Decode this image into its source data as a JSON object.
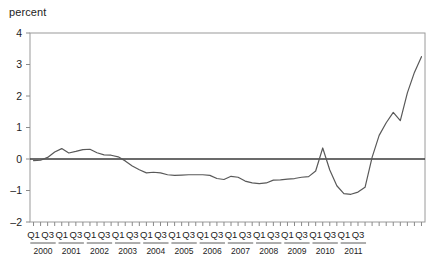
{
  "chart_data": {
    "type": "line",
    "title": "",
    "subtitle": "",
    "xlabel": "",
    "ylabel": "percent",
    "ylim": [
      -2,
      4
    ],
    "yticks": [
      4,
      3,
      2,
      1,
      0,
      -1,
      -2
    ],
    "ytick_labels": [
      "4",
      "3",
      "2",
      "1",
      "0",
      "-1",
      "-2"
    ],
    "grid": false,
    "legend": "none",
    "zero_line": true,
    "x_quarter_labels": [
      "Q1",
      "Q3"
    ],
    "years": [
      "2000",
      "2001",
      "2002",
      "2003",
      "2004",
      "2005",
      "2006",
      "2007",
      "2008",
      "2009",
      "2010",
      "2011"
    ],
    "x": [
      "2000Q1",
      "2000Q2",
      "2000Q3",
      "2000Q4",
      "2001Q1",
      "2001Q2",
      "2001Q3",
      "2001Q4",
      "2002Q1",
      "2002Q2",
      "2002Q3",
      "2002Q4",
      "2003Q1",
      "2003Q2",
      "2003Q3",
      "2003Q4",
      "2004Q1",
      "2004Q2",
      "2004Q3",
      "2004Q4",
      "2005Q1",
      "2005Q2",
      "2005Q3",
      "2005Q4",
      "2006Q1",
      "2006Q2",
      "2006Q3",
      "2006Q4",
      "2007Q1",
      "2007Q2",
      "2007Q3",
      "2007Q4",
      "2008Q1",
      "2008Q2",
      "2008Q3",
      "2008Q4",
      "2009Q1",
      "2009Q2",
      "2009Q3",
      "2009Q4",
      "2010Q1",
      "2010Q2",
      "2010Q3",
      "2010Q4",
      "2011Q1",
      "2011Q2",
      "2011Q3",
      "2011Q4"
    ],
    "values": [
      -0.05,
      -0.04,
      0.05,
      0.22,
      0.33,
      0.19,
      0.24,
      0.3,
      0.31,
      0.2,
      0.13,
      0.12,
      0.07,
      -0.06,
      -0.22,
      -0.34,
      -0.44,
      -0.42,
      -0.44,
      -0.5,
      -0.52,
      -0.51,
      -0.5,
      -0.5,
      -0.5,
      -0.52,
      -0.62,
      -0.65,
      -0.55,
      -0.58,
      -0.7,
      -0.76,
      -0.78,
      -0.76,
      -0.67,
      -0.66,
      -0.64,
      -0.62,
      -0.58,
      -0.56,
      -0.38,
      0.35,
      -0.35,
      -0.85,
      -1.1,
      -1.12,
      -1.05,
      -0.9
    ],
    "values_tail": [
      0.05,
      0.75,
      1.15,
      1.48,
      1.22,
      2.1,
      2.75,
      3.25
    ],
    "series_name": "percent",
    "line_color": "#595959",
    "axis_color": "#8a8a8a",
    "zero_line_color": "#3a3a3a"
  },
  "axis": {
    "y_label_text": "percent"
  }
}
